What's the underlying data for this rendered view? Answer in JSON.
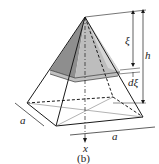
{
  "figure": {
    "caption": "(b)",
    "labels": {
      "xi": "ξ",
      "h": "h",
      "dxi": "dξ",
      "side_left": "a",
      "side_bottom": "a",
      "axis": "x"
    },
    "colors": {
      "line": "#1a1a1a",
      "shade_dark": "#8c8c8c",
      "shade_light": "#c8c8c8",
      "slice": "#b4b4b4"
    }
  }
}
